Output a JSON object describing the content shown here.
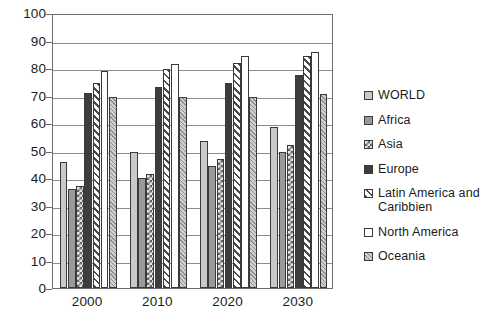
{
  "chart_data": {
    "type": "bar",
    "title": "",
    "subtitle": "",
    "xlabel": "",
    "ylabel": "",
    "ylim": [
      0,
      100
    ],
    "ytick_labels": [
      "100",
      "90",
      "80",
      "70",
      "60",
      "50",
      "40",
      "30",
      "20",
      "10",
      "0"
    ],
    "ytick_values": [
      100,
      90,
      80,
      70,
      60,
      50,
      40,
      30,
      20,
      10,
      0
    ],
    "grid": true,
    "grid_axis": "y",
    "legend_position": "right",
    "categories": [
      "2000",
      "2010",
      "2020",
      "2030"
    ],
    "series": [
      {
        "name": "WORLD",
        "swatch": "light-grey-solid",
        "color": "#c9c9c9",
        "values": [
          46,
          49.5,
          53.5,
          58.5
        ]
      },
      {
        "name": "Africa",
        "swatch": "mid-grey-solid",
        "color": "#9a9a9a",
        "values": [
          36,
          40,
          44.5,
          49.5
        ]
      },
      {
        "name": "Asia",
        "swatch": "checkerboard",
        "color": "#e4e4e4",
        "values": [
          37,
          41.5,
          47,
          52
        ]
      },
      {
        "name": "Europe",
        "swatch": "dark-grey-solid",
        "color": "#3d3d3d",
        "values": [
          71,
          73,
          74.5,
          77.5
        ]
      },
      {
        "name": "Latin America and Caribbien",
        "swatch": "diagonal-hatch",
        "color": "#ffffff",
        "values": [
          74.5,
          79.5,
          82,
          84.5
        ]
      },
      {
        "name": "North America",
        "swatch": "white-solid",
        "color": "#ffffff",
        "values": [
          79,
          81.5,
          84.5,
          86
        ]
      },
      {
        "name": "Oceania",
        "swatch": "fine-diagonal-texture",
        "color": "#c2c2c2",
        "values": [
          69.5,
          69.5,
          69.5,
          70.5
        ]
      }
    ]
  },
  "legend": {
    "items": [
      {
        "label": "WORLD"
      },
      {
        "label": "Africa"
      },
      {
        "label": "Asia"
      },
      {
        "label": "Europe"
      },
      {
        "label": "Latin America and Caribbien"
      },
      {
        "label": "North America"
      },
      {
        "label": "Oceania"
      }
    ]
  },
  "axes": {
    "y": {
      "ticks": [
        "100",
        "90",
        "80",
        "70",
        "60",
        "50",
        "40",
        "30",
        "20",
        "10",
        "0"
      ]
    },
    "x": {
      "ticks": [
        "2000",
        "2010",
        "2020",
        "2030"
      ]
    }
  }
}
